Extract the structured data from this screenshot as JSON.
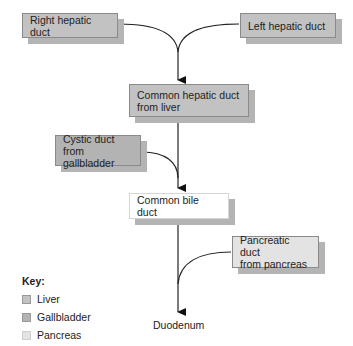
{
  "diagram": {
    "nodes": {
      "right_hepatic": {
        "label": "Right hepatic duct",
        "type": "liver"
      },
      "left_hepatic": {
        "label": "Left hepatic duct",
        "type": "liver"
      },
      "common_hepatic": {
        "label_line1": "Common hepatic duct",
        "label_line2": "from liver",
        "type": "liver"
      },
      "cystic": {
        "label_line1": "Cystic duct",
        "label_line2": "from gallbladder",
        "type": "gallbladder"
      },
      "common_bile": {
        "label": "Common bile duct",
        "type": "plain"
      },
      "pancreatic": {
        "label_line1": "Pancreatic duct",
        "label_line2": "from pancreas",
        "type": "pancreas"
      },
      "duodenum": {
        "label": "Duodenum"
      }
    },
    "edges": [
      {
        "from": "right_hepatic",
        "to": "common_hepatic"
      },
      {
        "from": "left_hepatic",
        "to": "common_hepatic"
      },
      {
        "from": "common_hepatic",
        "to": "common_bile"
      },
      {
        "from": "cystic",
        "to": "common_bile"
      },
      {
        "from": "common_bile",
        "to": "duodenum"
      },
      {
        "from": "pancreatic",
        "to": "duodenum"
      }
    ]
  },
  "key": {
    "title": "Key:",
    "items": [
      {
        "label": "Liver",
        "color": "#c2c2c2"
      },
      {
        "label": "Gallbladder",
        "color": "#b3b3b3"
      },
      {
        "label": "Pancreas",
        "color": "#e3e3e3"
      }
    ]
  }
}
